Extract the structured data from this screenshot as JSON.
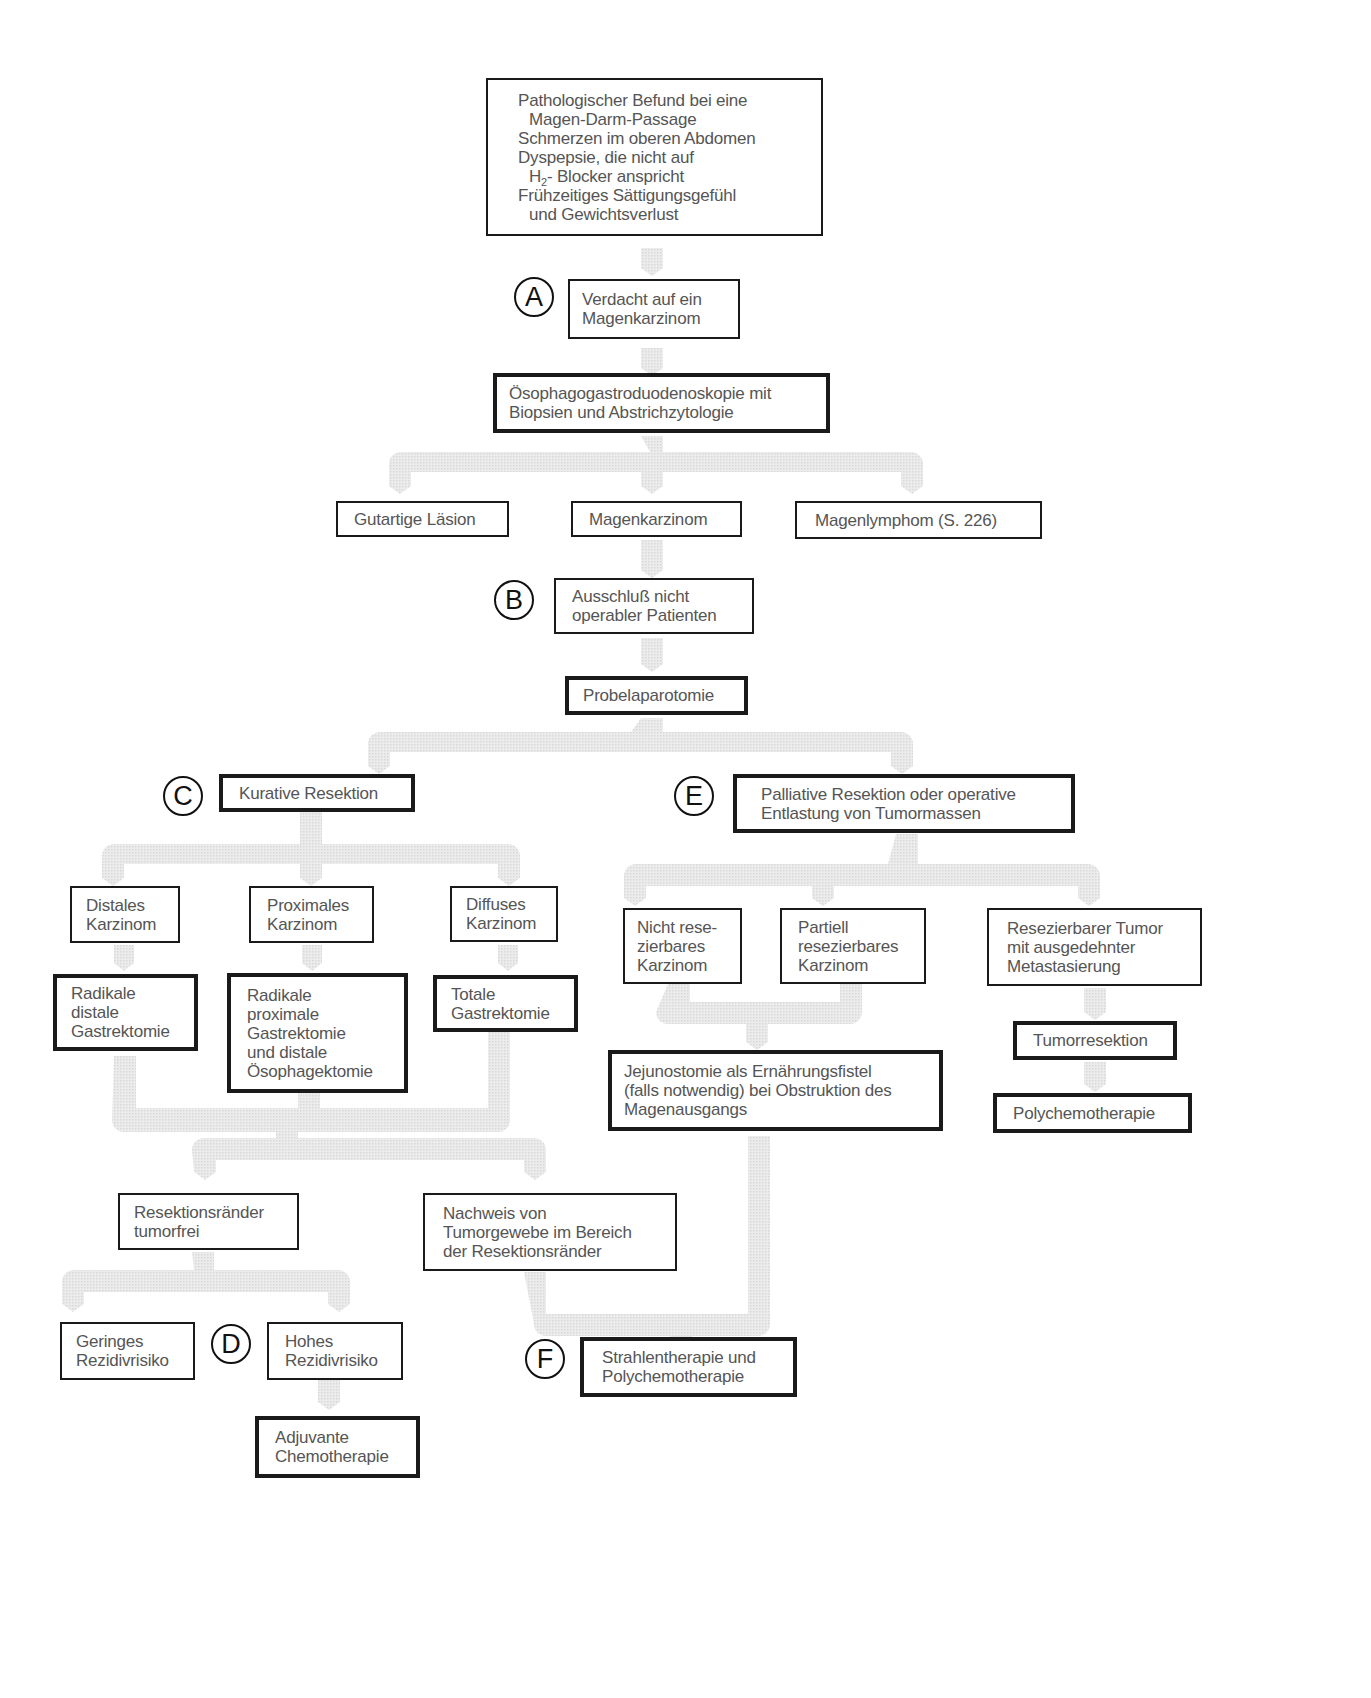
{
  "diagram": {
    "type": "clinical-decision-flowchart",
    "topic": "Magenkarzinom",
    "colors": {
      "box_border": "#1a1a1a",
      "text": "#555555",
      "connector": "#e4e4e4",
      "marker": "#111111",
      "background": "#ffffff"
    }
  },
  "markers": {
    "A": "A",
    "B": "B",
    "C": "C",
    "D": "D",
    "E": "E",
    "F": "F"
  },
  "nodes": {
    "symptoms": {
      "lines": [
        "Pathologischer Befund bei eine",
        "Magen-Darm-Passage",
        "Schmerzen im oberen Abdomen",
        "Dyspepsie, die nicht auf",
        "H",
        "2",
        "- Blocker anspricht",
        "Frühzeitiges Sättigungsgefühl",
        "und Gewichtsverlust"
      ]
    },
    "suspicion": {
      "lines": [
        "Verdacht auf ein",
        "Magenkarzinom"
      ]
    },
    "endoscopy": {
      "lines": [
        "Ösophagogastroduodenoskopie mit",
        "Biopsien und Abstrichzytologie"
      ]
    },
    "benign": {
      "label": "Gutartige Läsion"
    },
    "carcinoma": {
      "label": "Magenkarzinom"
    },
    "lymphoma": {
      "label": "Magenlymphom (S. 226)"
    },
    "exclusion": {
      "lines": [
        "Ausschluß nicht",
        "operabler Patienten"
      ]
    },
    "laparotomy": {
      "label": "Probelaparotomie"
    },
    "curative": {
      "label": "Kurative Resektion"
    },
    "palliative": {
      "lines": [
        "Palliative Resektion oder operative",
        "Entlastung von Tumormassen"
      ]
    },
    "distal_ca": {
      "lines": [
        "Distales",
        "Karzinom"
      ]
    },
    "proximal_ca": {
      "lines": [
        "Proximales",
        "Karzinom"
      ]
    },
    "diffuse_ca": {
      "lines": [
        "Diffuses",
        "Karzinom"
      ]
    },
    "distal_gastrectomy": {
      "lines": [
        "Radikale",
        "distale",
        "Gastrektomie"
      ]
    },
    "proximal_gastrectomy": {
      "lines": [
        "Radikale",
        "proximale",
        "Gastrektomie",
        "und distale",
        "Ösophagektomie"
      ]
    },
    "total_gastrectomy": {
      "lines": [
        "Totale",
        "Gastrektomie"
      ]
    },
    "margins_free": {
      "lines": [
        "Resektionsränder",
        "tumorfrei"
      ]
    },
    "margins_tumor": {
      "lines": [
        "Nachweis von",
        "Tumorgewebe im Bereich",
        "der Resektionsränder"
      ]
    },
    "low_risk": {
      "lines": [
        "Geringes",
        "Rezidivrisiko"
      ]
    },
    "high_risk": {
      "lines": [
        "Hohes",
        "Rezidivrisiko"
      ]
    },
    "adjuvant": {
      "lines": [
        "Adjuvante",
        "Chemotherapie"
      ]
    },
    "non_resectable": {
      "lines": [
        "Nicht rese-",
        "zierbares",
        "Karzinom"
      ]
    },
    "partial_resectable": {
      "lines": [
        "Partiell",
        "resezierbares",
        "Karzinom"
      ]
    },
    "resectable_metastatic": {
      "lines": [
        "Resezierbarer Tumor",
        "mit ausgedehnter",
        "Metastasierung"
      ]
    },
    "jejunostomy": {
      "lines": [
        "Jejunostomie als Ernährungsfistel",
        "(falls notwendig) bei Obstruktion des",
        "Magenausgangs"
      ]
    },
    "tumor_resection": {
      "label": "Tumorresektion"
    },
    "polychemo": {
      "label": "Polychemotherapie"
    },
    "radio_chemo": {
      "lines": [
        "Strahlentherapie und",
        "Polychemotherapie"
      ]
    }
  },
  "edges": [
    [
      "symptoms",
      "suspicion"
    ],
    [
      "suspicion",
      "endoscopy"
    ],
    [
      "endoscopy",
      "benign"
    ],
    [
      "endoscopy",
      "carcinoma"
    ],
    [
      "endoscopy",
      "lymphoma"
    ],
    [
      "carcinoma",
      "exclusion"
    ],
    [
      "exclusion",
      "laparotomy"
    ],
    [
      "laparotomy",
      "curative"
    ],
    [
      "laparotomy",
      "palliative"
    ],
    [
      "curative",
      "distal_ca"
    ],
    [
      "curative",
      "proximal_ca"
    ],
    [
      "curative",
      "diffuse_ca"
    ],
    [
      "distal_ca",
      "distal_gastrectomy"
    ],
    [
      "proximal_ca",
      "proximal_gastrectomy"
    ],
    [
      "diffuse_ca",
      "total_gastrectomy"
    ],
    [
      "distal_gastrectomy",
      "margins_free"
    ],
    [
      "proximal_gastrectomy",
      "margins_free"
    ],
    [
      "total_gastrectomy",
      "margins_free"
    ],
    [
      "distal_gastrectomy",
      "margins_tumor"
    ],
    [
      "proximal_gastrectomy",
      "margins_tumor"
    ],
    [
      "total_gastrectomy",
      "margins_tumor"
    ],
    [
      "margins_free",
      "low_risk"
    ],
    [
      "margins_free",
      "high_risk"
    ],
    [
      "high_risk",
      "adjuvant"
    ],
    [
      "palliative",
      "non_resectable"
    ],
    [
      "palliative",
      "partial_resectable"
    ],
    [
      "palliative",
      "resectable_metastatic"
    ],
    [
      "non_resectable",
      "jejunostomy"
    ],
    [
      "partial_resectable",
      "jejunostomy"
    ],
    [
      "resectable_metastatic",
      "tumor_resection"
    ],
    [
      "tumor_resection",
      "polychemo"
    ],
    [
      "margins_tumor",
      "radio_chemo"
    ],
    [
      "jejunostomy",
      "radio_chemo"
    ]
  ]
}
